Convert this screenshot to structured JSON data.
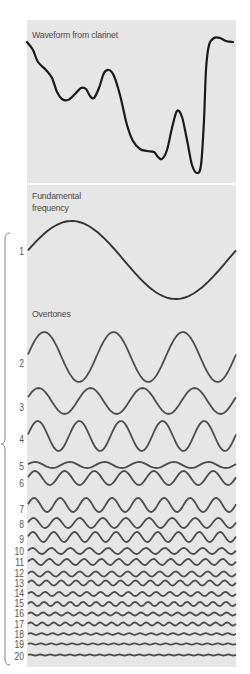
{
  "figure": {
    "waveform_title": "Waveform from clarinet",
    "fundamental_title": "Fundamental frequency",
    "overtones_title": "Overtones",
    "colors": {
      "panel_bg": "#e6e6e6",
      "waveform_stroke": "#1a1a1a",
      "wave_stroke": "#4d4d4d",
      "label_text": "#555555",
      "brace_stroke": "#777777"
    },
    "waveform_points": [
      [
        27,
        42
      ],
      [
        33,
        50
      ],
      [
        38,
        62
      ],
      [
        46,
        70
      ],
      [
        52,
        78
      ],
      [
        57,
        92
      ],
      [
        62,
        99
      ],
      [
        68,
        100
      ],
      [
        75,
        94
      ],
      [
        81,
        88
      ],
      [
        86,
        89
      ],
      [
        90,
        96
      ],
      [
        94,
        98
      ],
      [
        99,
        88
      ],
      [
        104,
        73
      ],
      [
        109,
        70
      ],
      [
        114,
        76
      ],
      [
        120,
        95
      ],
      [
        127,
        125
      ],
      [
        133,
        141
      ],
      [
        140,
        149
      ],
      [
        147,
        151
      ],
      [
        154,
        152
      ],
      [
        158,
        157
      ],
      [
        162,
        159
      ],
      [
        167,
        150
      ],
      [
        172,
        128
      ],
      [
        177,
        111
      ],
      [
        182,
        117
      ],
      [
        187,
        140
      ],
      [
        192,
        165
      ],
      [
        197,
        173
      ],
      [
        201,
        165
      ],
      [
        204,
        120
      ],
      [
        206,
        70
      ],
      [
        209,
        45
      ],
      [
        214,
        38
      ],
      [
        220,
        38
      ],
      [
        226,
        41
      ],
      [
        233,
        42
      ]
    ],
    "harmonics": [
      {
        "label": "1",
        "label_y": 252,
        "center_y": 260,
        "amplitude": 39,
        "cycles": 1,
        "phase": 0.25
      },
      {
        "label": "2",
        "label_y": 364,
        "center_y": 357,
        "amplitude": 25,
        "cycles": 3,
        "phase": 0.1
      },
      {
        "label": "3",
        "label_y": 408,
        "center_y": 401,
        "amplitude": 13,
        "cycles": 4,
        "phase": 0.3
      },
      {
        "label": "4",
        "label_y": 440,
        "center_y": 436,
        "amplitude": 15,
        "cycles": 5,
        "phase": 0.1
      },
      {
        "label": "5",
        "label_y": 467,
        "center_y": 465,
        "amplitude": 3,
        "cycles": 6,
        "phase": 0.3
      },
      {
        "label": "6",
        "label_y": 484,
        "center_y": 478,
        "amplitude": 7,
        "cycles": 7,
        "phase": 0.1
      },
      {
        "label": "7",
        "label_y": 510,
        "center_y": 505,
        "amplitude": 7,
        "cycles": 8,
        "phase": 0.1
      },
      {
        "label": "8",
        "label_y": 525,
        "center_y": 523,
        "amplitude": 5,
        "cycles": 9,
        "phase": 0.1
      },
      {
        "label": "9",
        "label_y": 540,
        "center_y": 537,
        "amplitude": 5,
        "cycles": 10,
        "phase": 0.1
      },
      {
        "label": "10",
        "label_y": 552,
        "center_y": 551,
        "amplitude": 3,
        "cycles": 11,
        "phase": 0.1
      },
      {
        "label": "11",
        "label_y": 563,
        "center_y": 562,
        "amplitude": 3,
        "cycles": 12,
        "phase": 0.1
      },
      {
        "label": "12",
        "label_y": 574,
        "center_y": 574,
        "amplitude": 2.5,
        "cycles": 13,
        "phase": 0.1
      },
      {
        "label": "13",
        "label_y": 584,
        "center_y": 583,
        "amplitude": 2.5,
        "cycles": 14,
        "phase": 0.1
      },
      {
        "label": "14",
        "label_y": 594,
        "center_y": 594,
        "amplitude": 2,
        "cycles": 15,
        "phase": 0.1
      },
      {
        "label": "15",
        "label_y": 604,
        "center_y": 604,
        "amplitude": 2,
        "cycles": 16,
        "phase": 0.1
      },
      {
        "label": "16",
        "label_y": 614,
        "center_y": 614,
        "amplitude": 1.5,
        "cycles": 17,
        "phase": 0.1
      },
      {
        "label": "17",
        "label_y": 625,
        "center_y": 624,
        "amplitude": 1.5,
        "cycles": 18,
        "phase": 0.1
      },
      {
        "label": "18",
        "label_y": 635,
        "center_y": 634,
        "amplitude": 0.8,
        "cycles": 19,
        "phase": 0.1
      },
      {
        "label": "19",
        "label_y": 645,
        "center_y": 644,
        "amplitude": 0.6,
        "cycles": 20,
        "phase": 0.1
      },
      {
        "label": "20",
        "label_y": 657,
        "center_y": 655,
        "amplitude": 0.5,
        "cycles": 21,
        "phase": 0.1
      }
    ],
    "brace": {
      "x": 5,
      "top": 233,
      "mid": 444,
      "bottom": 665
    }
  }
}
